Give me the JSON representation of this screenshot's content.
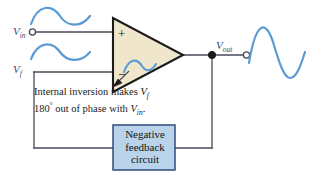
{
  "figure": {
    "type": "circuit-diagram"
  },
  "labels": {
    "v_in": "V",
    "v_in_sub": "in",
    "v_f": "V",
    "v_f_sub": "f",
    "v_out": "V",
    "v_out_sub": "out"
  },
  "opamp": {
    "plus_sign": "+",
    "minus_sign": "−",
    "fill_color": "#efe6cc",
    "stroke_color": "#1a1a1a"
  },
  "annotation": {
    "line1_a": "Internal inversion makes ",
    "line1_var": "V",
    "line1_var_sub": "f",
    "line2_a": "180",
    "line2_deg": "°",
    "line2_b": " out of phase with ",
    "line2_var": "V",
    "line2_var_sub": "in",
    "line2_end": "."
  },
  "feedback_box": {
    "line1": "Negative",
    "line2": "feedback",
    "line3": "circuit",
    "fill_color": "#b9d4ea",
    "stroke_color": "#2f4b7c"
  },
  "waveforms": {
    "input_wave_color": "#5b9bd5",
    "feedback_wave_color": "#5b9bd5",
    "internal_wave_color": "#5b9bd5",
    "output_wave_color": "#5b9bd5"
  },
  "wires": {
    "color": "#4a4a5a"
  }
}
